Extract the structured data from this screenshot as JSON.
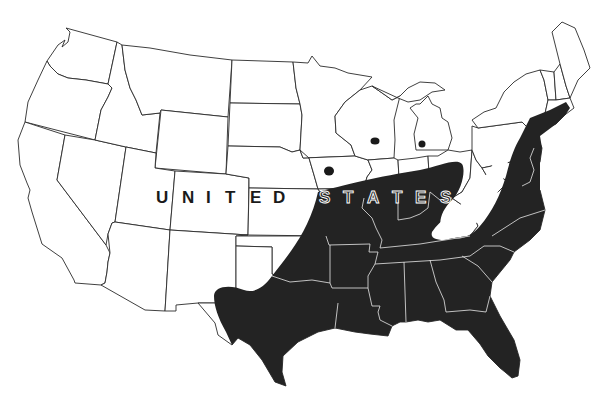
{
  "map": {
    "type": "outline map",
    "region": "Contiguous United States",
    "country_label": {
      "letters": [
        "U",
        "N",
        "I",
        "T",
        "E",
        "D",
        "S",
        "T",
        "A",
        "T",
        "E",
        "S"
      ],
      "text": "UNITED STATES"
    },
    "colors": {
      "background": "#ffffff",
      "state_outline": "#2a2a2a",
      "shaded_range": "#232323",
      "dots": "#1a1a1a"
    },
    "shaded_range": {
      "description": "Southeastern and south-central US, from Texas and Oklahoma east to the Atlantic coast and north to New Jersey/Connecticut",
      "states": [
        "Texas",
        "Oklahoma",
        "Kansas (southeast)",
        "Missouri",
        "Arkansas",
        "Louisiana",
        "Mississippi",
        "Alabama",
        "Georgia",
        "Florida",
        "South Carolina",
        "North Carolina",
        "Tennessee",
        "Kentucky",
        "Illinois (southern)",
        "Indiana (southern)",
        "Ohio (southern)",
        "Virginia",
        "Maryland",
        "Delaware",
        "New Jersey",
        "Pennsylvania (southeast)",
        "New York (southeast)",
        "Connecticut",
        "Rhode Island"
      ],
      "excluded_gap": "Appalachian highlands (West Virginia / western Virginia)"
    },
    "isolated_points": [
      {
        "id": "dot-1",
        "approx_location": "southern Iowa",
        "x": 329,
        "y": 171
      },
      {
        "id": "dot-2",
        "approx_location": "southern Wisconsin / northern Illinois",
        "x": 375,
        "y": 141
      },
      {
        "id": "dot-3",
        "approx_location": "southern Michigan",
        "x": 422,
        "y": 144
      }
    ]
  }
}
